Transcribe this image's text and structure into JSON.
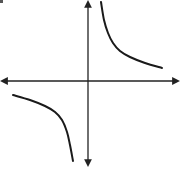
{
  "chart_data": {
    "type": "line",
    "title": "",
    "xlabel": "",
    "ylabel": "",
    "function": "y = k/x (k > 0)",
    "grid": false,
    "legend": null,
    "xlim": [
      -1,
      1
    ],
    "ylim": [
      -1,
      1
    ],
    "axes": {
      "origin_px": [
        88,
        81
      ],
      "x_axis": {
        "from_px": 0,
        "to_px": 178,
        "arrows": [
          "left",
          "right"
        ]
      },
      "y_axis": {
        "from_px": 0,
        "to_px": 165,
        "arrows": [
          "up",
          "down"
        ]
      }
    },
    "series": [
      {
        "name": "branch-quadrant-I",
        "points_px": [
          [
            101,
            2
          ],
          [
            104,
            20
          ],
          [
            108,
            33
          ],
          [
            113,
            43
          ],
          [
            120,
            51
          ],
          [
            130,
            57
          ],
          [
            145,
            63
          ],
          [
            162,
            68
          ]
        ]
      },
      {
        "name": "branch-quadrant-III",
        "points_px": [
          [
            13,
            95
          ],
          [
            30,
            100
          ],
          [
            45,
            106
          ],
          [
            55,
            112
          ],
          [
            62,
            120
          ],
          [
            67,
            132
          ],
          [
            70,
            145
          ],
          [
            73,
            161
          ]
        ]
      }
    ],
    "colors": {
      "curve": "#1a1a1a",
      "axis": "#222222",
      "background": "#ffffff"
    }
  }
}
